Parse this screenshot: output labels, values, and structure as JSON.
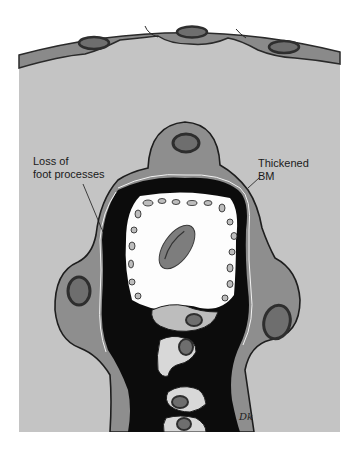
{
  "figure": {
    "labels": [
      {
        "id": "loss-of-foot-processes",
        "text": "Loss of\nfoot processes"
      },
      {
        "id": "thickened-bm",
        "text": "Thickened\nBM"
      }
    ],
    "signature": "Dk",
    "colors": {
      "background": "#ffffff",
      "urinary_space": "#c4c4c4",
      "epithelium": "#8a8a8a",
      "podocyte_cytoplasm": "#8e8e8e",
      "nucleus_outer": "#2e2e2e",
      "nucleus_inner": "#6e6e6e",
      "basement_membrane": "#0c0c0c",
      "lumen": "#fdfdfd",
      "endothelium": "#bdbdbd",
      "red_blood_cell": "#7d7d7d"
    }
  }
}
